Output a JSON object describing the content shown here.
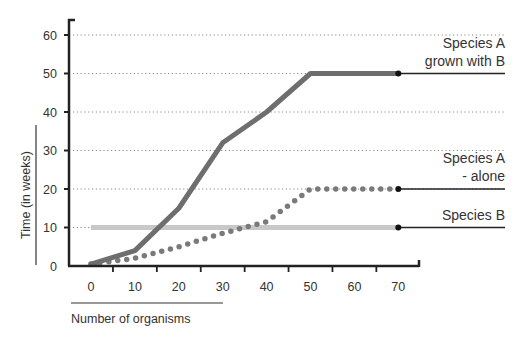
{
  "chart_data": {
    "type": "line",
    "title": "",
    "xlabel": "Number of organisms",
    "ylabel": "Time (in weeks)",
    "x_ticks": [
      0,
      10,
      20,
      30,
      40,
      50,
      60,
      70
    ],
    "y_ticks": [
      0,
      10,
      20,
      30,
      40,
      50,
      60
    ],
    "xlim": [
      0,
      70
    ],
    "ylim": [
      0,
      60
    ],
    "grid": "horizontal dotted",
    "legend_position": "right (inline labels with leader lines)",
    "series": [
      {
        "name": "Species A grown with B",
        "label_lines": [
          "Species A",
          "grown with B"
        ],
        "style": "solid",
        "color": "#6e6e6e",
        "x": [
          0,
          10,
          20,
          30,
          40,
          50,
          60,
          70
        ],
        "values": [
          0.5,
          4,
          15,
          32,
          40,
          50,
          50,
          50
        ]
      },
      {
        "name": "Species A - alone",
        "label_lines": [
          "Species A",
          "- alone"
        ],
        "style": "dotted",
        "color": "#7a7a7a",
        "x": [
          0,
          10,
          20,
          30,
          40,
          50,
          60,
          70
        ],
        "values": [
          0.5,
          2,
          5,
          8.5,
          11.5,
          20,
          20,
          20
        ]
      },
      {
        "name": "Species B",
        "label_lines": [
          "Species B"
        ],
        "style": "solid",
        "color": "#c8c8c8",
        "x": [
          0,
          10,
          20,
          30,
          40,
          50,
          60,
          70
        ],
        "values": [
          10,
          10,
          10,
          10,
          10,
          10,
          10,
          10
        ]
      }
    ]
  },
  "layout": {
    "plot_left": 69,
    "plot_bottom": 266,
    "y_px_per_unit": 3.85,
    "x0_px": 91,
    "x_px_per_unit": 4.39,
    "axis_top": 20,
    "axis_right": 419,
    "leader_end_x": 505
  }
}
